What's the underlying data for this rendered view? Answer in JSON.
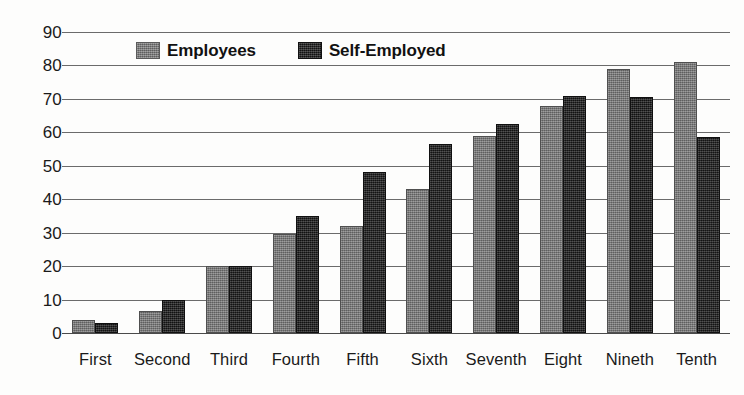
{
  "chart_data": {
    "type": "bar",
    "title": "",
    "xlabel": "",
    "ylabel": "",
    "ylim": [
      0,
      90
    ],
    "yticks": [
      0,
      10,
      20,
      30,
      40,
      50,
      60,
      70,
      80,
      90
    ],
    "grid": true,
    "legend_position": "top-left-inside",
    "categories": [
      "First",
      "Second",
      "Third",
      "Fourth",
      "Fifth",
      "Sixth",
      "Seventh",
      "Eight",
      "Nineth",
      "Tenth"
    ],
    "series": [
      {
        "name": "Employees",
        "color": "#787878",
        "values": [
          4,
          6.5,
          20,
          29.5,
          32,
          43,
          59,
          68,
          79,
          81
        ]
      },
      {
        "name": "Self-Employed",
        "color": "#1d1d1d",
        "values": [
          3,
          10,
          20,
          35,
          48,
          56.5,
          62.5,
          71,
          70.5,
          58.5
        ]
      }
    ]
  },
  "legend": {
    "entries": [
      {
        "label": "Employees",
        "swatch": "legend-swatch-employees"
      },
      {
        "label": "Self-Employed",
        "swatch": "legend-swatch-self-employed"
      }
    ]
  },
  "axis": {
    "y_tick_labels": [
      "90",
      "80",
      "70",
      "60",
      "50",
      "40",
      "30",
      "20",
      "10",
      "0"
    ],
    "x_tick_labels": [
      "First",
      "Second",
      "Third",
      "Fourth",
      "Fifth",
      "Sixth",
      "Seventh",
      "Eight",
      "Nineth",
      "Tenth"
    ]
  }
}
